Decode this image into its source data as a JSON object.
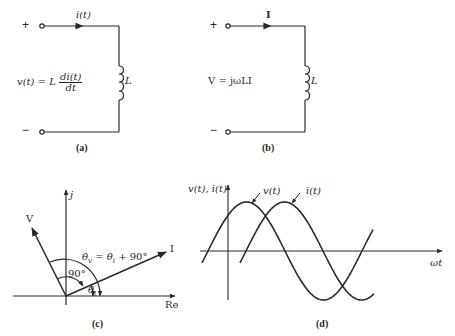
{
  "figure": {
    "panels": [
      {
        "id": "a",
        "caption": "(a)",
        "terminal_plus": "+",
        "terminal_minus": "−",
        "current_label": "i(t)",
        "equation_lhs": "v(t) = L",
        "equation_num": "di(t)",
        "equation_den": "dt",
        "element_label": "L"
      },
      {
        "id": "b",
        "caption": "(b)",
        "terminal_plus": "+",
        "terminal_minus": "−",
        "current_label": "I",
        "equation": "V = jωLI",
        "element_label": "L"
      },
      {
        "id": "c",
        "caption": "(c)",
        "imag_axis_label": "j",
        "real_axis_label": "Re",
        "voltage_phasor_label": "V",
        "current_phasor_label": "I",
        "angle_relation": "θv = θi + 90°",
        "angle_relation_parts": {
          "theta_v": "θ",
          "sub_v": "v",
          "mid": " = θ",
          "sub_i": "i",
          "tail": " + 90°"
        },
        "right_angle_label": "90°",
        "theta_i_label": "θ",
        "theta_i_sub": "i"
      },
      {
        "id": "d",
        "caption": "(d)",
        "y_axis_label": "v(t), i(t)",
        "x_axis_label": "ωt",
        "voltage_curve_label": "v(t)",
        "current_curve_label": "i(t)"
      }
    ]
  },
  "colors": {
    "ink": "#2a2a2a",
    "background": "#ffffff"
  }
}
